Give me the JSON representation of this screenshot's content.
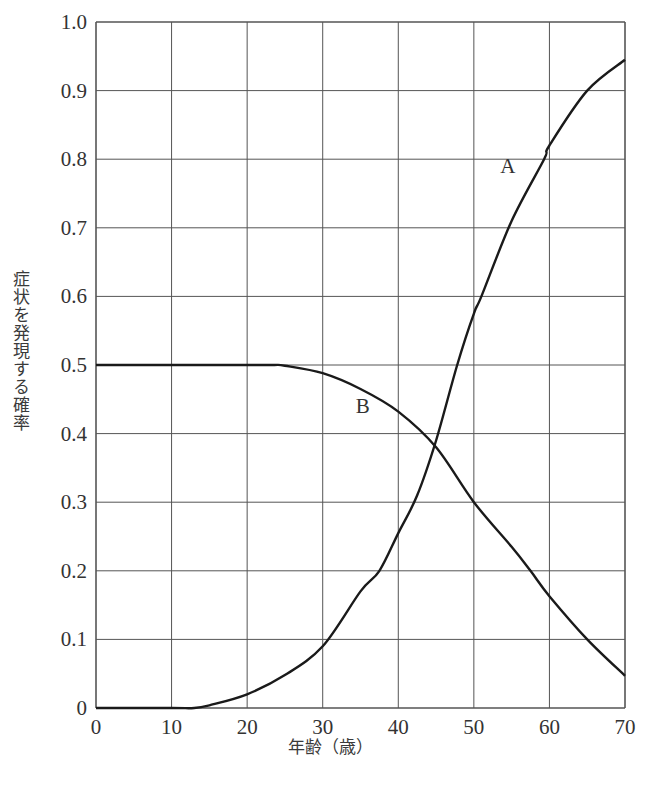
{
  "chart_data": {
    "type": "line",
    "title": "",
    "xlabel": "年齢（歳）",
    "ylabel": "症状を発現する確率",
    "xlim": [
      0,
      70
    ],
    "ylim": [
      0,
      1.0
    ],
    "grid": true,
    "x_ticks": [
      0,
      10,
      20,
      30,
      40,
      50,
      60,
      70
    ],
    "y_ticks": [
      0,
      0.1,
      0.2,
      0.3,
      0.4,
      0.5,
      0.6,
      0.7,
      0.8,
      0.9,
      1.0
    ],
    "x_tick_labels": [
      "0",
      "10",
      "20",
      "30",
      "40",
      "50",
      "60",
      "70"
    ],
    "y_tick_labels": [
      "0",
      "0.1",
      "0.2",
      "0.3",
      "0.4",
      "0.5",
      "0.6",
      "0.7",
      "0.8",
      "0.9",
      "1.0"
    ],
    "legend": "none (curves labeled inline)",
    "series": [
      {
        "name": "A",
        "label_position": {
          "x": 54.5,
          "y": 0.78
        },
        "x": [
          0,
          10,
          13,
          15,
          20,
          25,
          30,
          35,
          37.5,
          40,
          42.5,
          45,
          47.8,
          50,
          51,
          55,
          59.3,
          60,
          65,
          70
        ],
        "values": [
          0,
          0,
          0,
          0.004,
          0.02,
          0.048,
          0.09,
          0.17,
          0.2,
          0.255,
          0.31,
          0.39,
          0.5,
          0.575,
          0.6,
          0.71,
          0.8,
          0.82,
          0.9,
          0.945
        ]
      },
      {
        "name": "B",
        "label_position": {
          "x": 35.3,
          "y": 0.43
        },
        "x": [
          0,
          10,
          20,
          23.5,
          25,
          30,
          35,
          40,
          45,
          50,
          55,
          57.5,
          60,
          65,
          70
        ],
        "values": [
          0.5,
          0.5,
          0.5,
          0.5,
          0.499,
          0.488,
          0.465,
          0.432,
          0.38,
          0.3,
          0.235,
          0.2,
          0.163,
          0.1,
          0.047
        ]
      }
    ]
  },
  "colors": {
    "line": "#1a1a1a",
    "grid": "#555555",
    "text": "#333333"
  }
}
